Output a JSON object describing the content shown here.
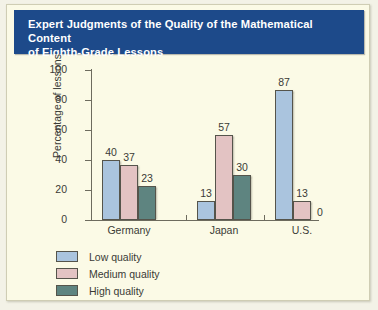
{
  "title": "Expert Judgments of the Quality of the Mathematical Content\nof Eighth-Grade Lessons",
  "colors": {
    "title_band": "#1d4a8a",
    "panel_background": "#fbfae6",
    "low_quality": "#aac4de",
    "medium_quality": "#e3c3c3",
    "high_quality": "#5e8480",
    "axis": "#6d6b5e",
    "text": "#3a3a36"
  },
  "chart_data": {
    "type": "bar",
    "title": "Expert Judgments of the Quality of the Mathematical Content of Eighth-Grade Lessons",
    "xlabel": "",
    "ylabel": "Percentage of lessons",
    "ylim": [
      0,
      100
    ],
    "yticks": [
      0,
      20,
      40,
      60,
      80,
      100
    ],
    "grid": false,
    "legend_position": "below-left",
    "categories": [
      "Germany",
      "Japan",
      "U.S."
    ],
    "series": [
      {
        "name": "Low quality",
        "color": "#aac4de",
        "values": [
          40,
          13,
          87
        ]
      },
      {
        "name": "Medium quality",
        "color": "#e3c3c3",
        "values": [
          37,
          57,
          13
        ]
      },
      {
        "name": "High quality",
        "color": "#5e8480",
        "values": [
          23,
          30,
          0
        ]
      }
    ]
  }
}
